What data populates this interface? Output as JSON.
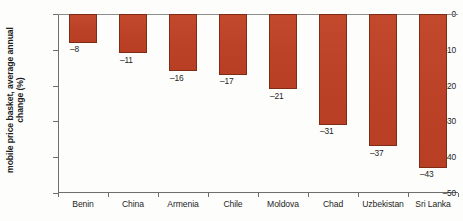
{
  "chart_data": {
    "type": "bar",
    "title": "",
    "subtitle": "",
    "xlabel": "",
    "ylabel_line1": "mobile price basket, average annual",
    "ylabel_line2": "change (%)",
    "ylabel": "mobile price basket, average annual change (%)",
    "categories": [
      "Benin",
      "China",
      "Armenia",
      "Chile",
      "Moldova",
      "Chad",
      "Uzbekistan",
      "Sri Lanka"
    ],
    "values": [
      -8,
      -11,
      -16,
      -17,
      -21,
      -31,
      -37,
      -43
    ],
    "value_labels": [
      "–8",
      "–11",
      "–16",
      "–17",
      "–21",
      "–31",
      "–37",
      "–43"
    ],
    "ylim": [
      -50,
      0
    ],
    "yticks": [
      0,
      -10,
      -20,
      -30,
      -40,
      -50
    ],
    "ytick_labels": [
      "0",
      "–10",
      "–20",
      "–30",
      "–40",
      "–50"
    ],
    "grid": false,
    "legend": null,
    "bar_color": "#bb4227",
    "bar_edge_color": "#7f2c17",
    "axis_color": "#6e6e6e",
    "text_color": "#1f1f1f",
    "background": "#fdfdfb"
  }
}
